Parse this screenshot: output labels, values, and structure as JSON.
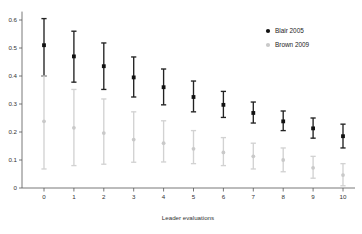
{
  "chart_data": {
    "type": "scatter",
    "title": "",
    "xlabel": "Leader evaluations",
    "ylabel": "",
    "xlim": [
      -0.45,
      10.45
    ],
    "ylim": [
      0,
      0.63
    ],
    "grid": false,
    "legend_position": "top-right",
    "x_ticks": [
      "0",
      "1",
      "2",
      "3",
      "4",
      "5",
      "6",
      "7",
      "8",
      "9",
      "10"
    ],
    "y_ticks": [
      "0",
      "0.1",
      "0.2",
      "0.3",
      "0.4",
      "0.5",
      "0.6"
    ],
    "x": [
      0,
      1,
      2,
      3,
      4,
      5,
      6,
      7,
      8,
      9,
      10
    ],
    "series": [
      {
        "name": "Blair 2005",
        "color": "#111111",
        "marker": "filled-circle",
        "values": [
          0.51,
          0.47,
          0.435,
          0.395,
          0.36,
          0.325,
          0.297,
          0.268,
          0.238,
          0.213,
          0.185
        ],
        "error_low": [
          0.4,
          0.378,
          0.352,
          0.325,
          0.297,
          0.272,
          0.252,
          0.232,
          0.205,
          0.178,
          0.143
        ],
        "error_high": [
          0.605,
          0.56,
          0.518,
          0.468,
          0.425,
          0.382,
          0.345,
          0.307,
          0.275,
          0.25,
          0.228
        ]
      },
      {
        "name": "Brown 2009",
        "color": "#c9c9c9",
        "marker": "open-circle",
        "values": [
          0.238,
          0.215,
          0.196,
          0.173,
          0.16,
          0.14,
          0.127,
          0.113,
          0.1,
          0.072,
          0.046
        ],
        "error_low": [
          0.068,
          0.08,
          0.085,
          0.092,
          0.093,
          0.087,
          0.08,
          0.068,
          0.058,
          0.035,
          0.008
        ],
        "error_high": [
          0.4,
          0.352,
          0.318,
          0.272,
          0.24,
          0.205,
          0.18,
          0.16,
          0.143,
          0.113,
          0.087
        ]
      }
    ]
  },
  "legend": {
    "items": [
      {
        "label": "Blair 2005",
        "color": "#111111"
      },
      {
        "label": "Brown 2009",
        "color": "#c9c9c9"
      }
    ]
  },
  "axes": {
    "x_title": "Leader evaluations"
  }
}
